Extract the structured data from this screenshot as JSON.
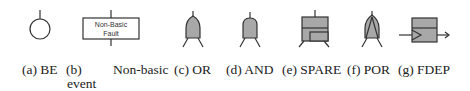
{
  "figure": {
    "colors": {
      "stroke": "#333333",
      "gate_fill": "#a8a8a8",
      "background": "#ffffff"
    },
    "symbols": [
      {
        "id": "a",
        "name": "BE",
        "shape": "circle"
      },
      {
        "id": "b",
        "name": "Non-basic event",
        "shape": "rectangle",
        "box_text_line1": "Non-Basic",
        "box_text_line2": "Fault"
      },
      {
        "id": "c",
        "name": "OR",
        "shape": "or-gate"
      },
      {
        "id": "d",
        "name": "AND",
        "shape": "and-gate"
      },
      {
        "id": "e",
        "name": "SPARE",
        "shape": "spare-gate"
      },
      {
        "id": "f",
        "name": "POR",
        "shape": "por-gate"
      },
      {
        "id": "g",
        "name": "FDEP",
        "shape": "fdep-gate"
      }
    ],
    "captions": {
      "a": "(a) BE",
      "b_prefix": "(b)",
      "b_word1": "Non-basic",
      "b_word2": "event",
      "c": "(c) OR",
      "d": "(d) AND",
      "e": "(e) SPARE",
      "f": "(f) POR",
      "g": "(g) FDEP"
    }
  }
}
